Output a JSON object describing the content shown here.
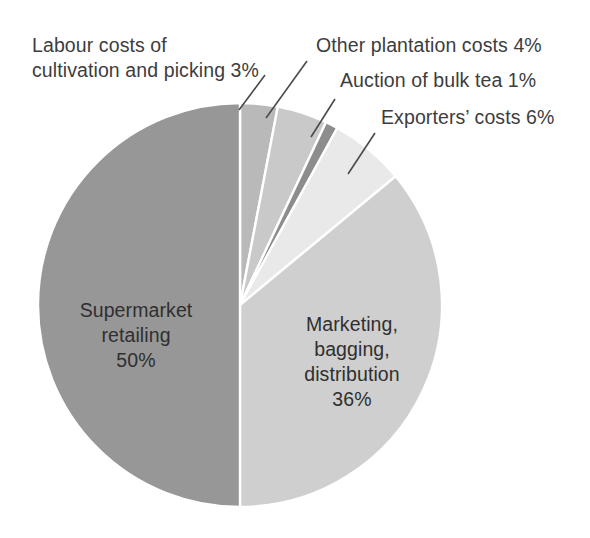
{
  "chart_data": {
    "type": "pie",
    "title": "",
    "subtitle": "",
    "xlabel": "",
    "ylabel": "",
    "legend_position": "none",
    "grid": false,
    "unit": "%",
    "total": 100,
    "start_angle_deg": 0,
    "direction": "clockwise",
    "center": {
      "x": 240,
      "y": 305
    },
    "radius": 202,
    "categories": [
      "Labour costs of cultivation and picking",
      "Other plantation costs",
      "Auction of bulk tea",
      "Exporters' costs",
      "Marketing, bagging, distribution",
      "Supermarket retailing"
    ],
    "values": [
      3,
      4,
      1,
      6,
      36,
      50
    ],
    "slices": [
      {
        "key": "labour",
        "name": "Labour costs of cultivation and picking",
        "value": 3,
        "value_text": "3%",
        "label_text": "Labour costs of\ncultivation and picking 3%",
        "color": "#b9b9b9",
        "label_placement": "callout",
        "start_deg": 0,
        "end_deg": 10.8
      },
      {
        "key": "plantation",
        "name": "Other plantation costs",
        "value": 4,
        "value_text": "4%",
        "label_text": "Other plantation costs 4%",
        "color": "#c9c9c9",
        "label_placement": "callout",
        "start_deg": 10.8,
        "end_deg": 25.2
      },
      {
        "key": "auction",
        "name": "Auction of bulk tea",
        "value": 1,
        "value_text": "1%",
        "label_text": "Auction of bulk tea 1%",
        "color": "#8d8d8d",
        "label_placement": "callout",
        "start_deg": 25.2,
        "end_deg": 28.8
      },
      {
        "key": "exporters",
        "name": "Exporters' costs",
        "value": 6,
        "value_text": "6%",
        "label_text": "Exporters’ costs 6%",
        "color": "#e9e9e9",
        "label_placement": "callout",
        "start_deg": 28.8,
        "end_deg": 50.4
      },
      {
        "key": "marketing",
        "name": "Marketing, bagging, distribution",
        "value": 36,
        "value_text": "36%",
        "label_text": "Marketing,\nbagging,\ndistribution\n36%",
        "color": "#cfcfcf",
        "label_placement": "inside",
        "start_deg": 50.4,
        "end_deg": 180
      },
      {
        "key": "supermarket",
        "name": "Supermarket retailing",
        "value": 50,
        "value_text": "50%",
        "label_text": "Supermarket\nretailing\n50%",
        "color": "#979797",
        "label_placement": "inside",
        "start_deg": 180,
        "end_deg": 360
      }
    ]
  },
  "style": {
    "background": "#ffffff",
    "slice_separator_color": "#ffffff",
    "leader_line_color": "#4a4a4a",
    "text_color": "#3d3d3d"
  },
  "labels": {
    "labour": "Labour costs of\ncultivation and picking 3%",
    "plantation": "Other plantation costs 4%",
    "auction": "Auction of bulk tea 1%",
    "exporters": "Exporters’ costs 6%",
    "marketing": "Marketing,\nbagging,\ndistribution\n36%",
    "supermarket": "Supermarket\nretailing\n50%"
  }
}
